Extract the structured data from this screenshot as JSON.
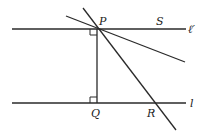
{
  "diagram": {
    "labels": {
      "P": "P",
      "S": "S",
      "Q": "Q",
      "R": "R",
      "l_prime": "ℓ′",
      "l": "l"
    },
    "points": {
      "P": [
        97,
        29
      ],
      "Q": [
        97,
        103
      ],
      "R": [
        155,
        103
      ]
    },
    "colors": {
      "line": "#2a2a2a",
      "background": "#ffffff"
    }
  }
}
